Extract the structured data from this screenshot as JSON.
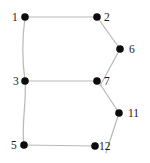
{
  "diagram": {
    "type": "graph",
    "nodes": [
      {
        "id": "1",
        "label": "1",
        "x": 25,
        "y": 17,
        "label_dx": -13,
        "label_dy": 0
      },
      {
        "id": "2",
        "label": "2",
        "x": 97,
        "y": 17,
        "label_dx": 7,
        "label_dy": 0
      },
      {
        "id": "6",
        "label": "6",
        "x": 120,
        "y": 49,
        "label_dx": 9,
        "label_dy": 0
      },
      {
        "id": "3",
        "label": "3",
        "x": 25,
        "y": 81,
        "label_dx": -12,
        "label_dy": 0
      },
      {
        "id": "7",
        "label": "7",
        "x": 97,
        "y": 81,
        "label_dx": 7,
        "label_dy": 0
      },
      {
        "id": "11",
        "label": "11",
        "x": 119,
        "y": 113,
        "label_dx": 9,
        "label_dy": 0
      },
      {
        "id": "5",
        "label": "5",
        "x": 24,
        "y": 145,
        "label_dx": -13,
        "label_dy": 0
      },
      {
        "id": "12",
        "label": "12",
        "x": 95,
        "y": 146,
        "label_dx": 4,
        "label_dy": 0
      }
    ],
    "edges": [
      {
        "from": "1",
        "to": "2",
        "path": "M25,17 L97,17"
      },
      {
        "from": "1",
        "to": "3",
        "path": "M25,17 C22,40 22,60 25,81"
      },
      {
        "from": "2",
        "to": "6",
        "path": "M97,17 L120,49"
      },
      {
        "from": "6",
        "to": "7",
        "path": "M120,49 L100,86"
      },
      {
        "from": "3",
        "to": "7",
        "path": "M25,81 L97,81"
      },
      {
        "from": "3",
        "to": "5",
        "path": "M25,81 C27,100 21,125 24,145"
      },
      {
        "from": "7",
        "to": "11",
        "path": "M100,84 L119,113"
      },
      {
        "from": "5",
        "to": "12",
        "path": "M24,145 L95,146"
      },
      {
        "from": "11",
        "to": "12",
        "path": "M119,113 L106,153"
      }
    ],
    "style": {
      "node_color": "#0d0d0d",
      "edge_color": "#b8b8b8",
      "background": "#ffffff",
      "node_radius": 3.8
    }
  }
}
